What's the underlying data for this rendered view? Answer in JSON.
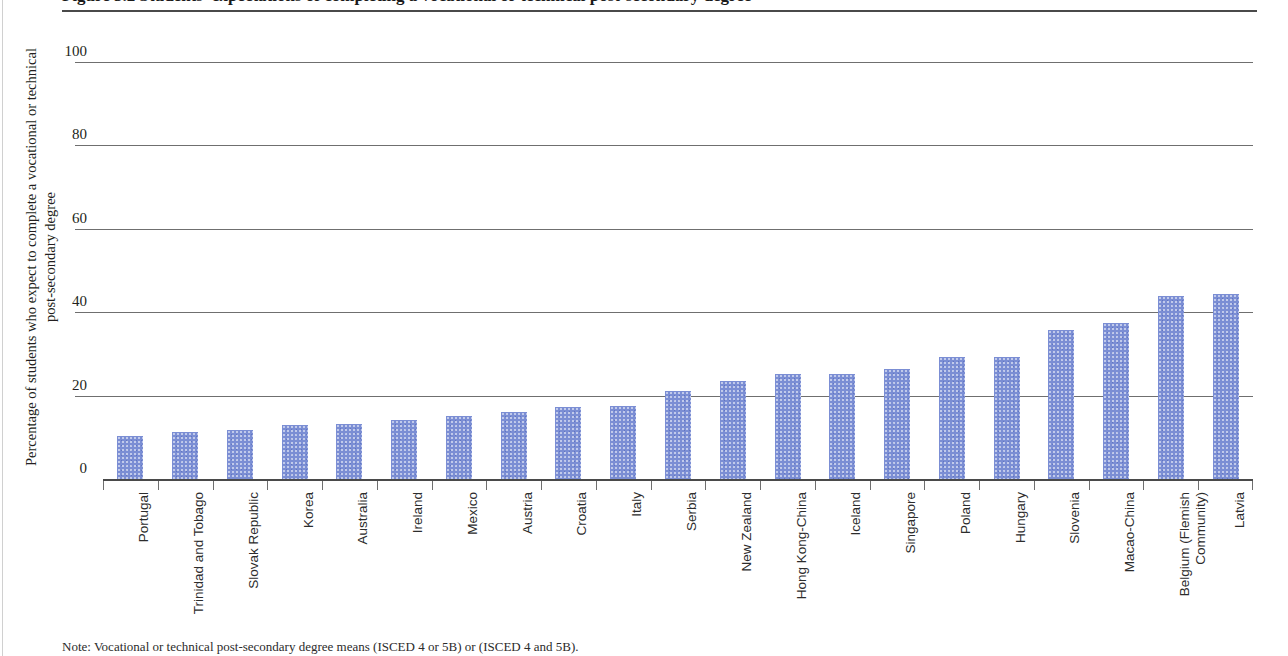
{
  "figure": {
    "title_clipped": "Figure 5.2  Students' expectations of completing a vocational or technical post-secondary degree",
    "note_clipped": "Note: Vocational or technical post-secondary degree means (ISCED 4 or 5B) or (ISCED 4 and 5B)."
  },
  "chart_data": {
    "type": "bar",
    "title": "",
    "xlabel": "",
    "ylabel": "Percentage of students who expect to complete a vocational or technical post-secondary degree",
    "ylim": [
      0,
      100
    ],
    "yticks": [
      0,
      20,
      40,
      60,
      80,
      100
    ],
    "grid": true,
    "legend": "none",
    "bar_color": "#7b8ed4",
    "categories": [
      "Portugal",
      "Trinidad and Tobago",
      "Slovak Republic",
      "Korea",
      "Australia",
      "Ireland",
      "Mexico",
      "Austria",
      "Croatia",
      "Italy",
      "Serbia",
      "New Zealand",
      "Hong Kong-China",
      "Iceland",
      "Singapore",
      "Poland",
      "Hungary",
      "Slovenia",
      "Macao-China",
      "Belgium (Flemish Community)",
      "Latvia"
    ],
    "values": [
      10.3,
      11.3,
      11.8,
      12.9,
      13.2,
      14.2,
      15.0,
      16.0,
      17.3,
      17.4,
      21.0,
      23.5,
      25.2,
      25.3,
      26.4,
      29.3,
      29.3,
      35.8,
      37.5,
      43.8,
      44.4
    ]
  }
}
